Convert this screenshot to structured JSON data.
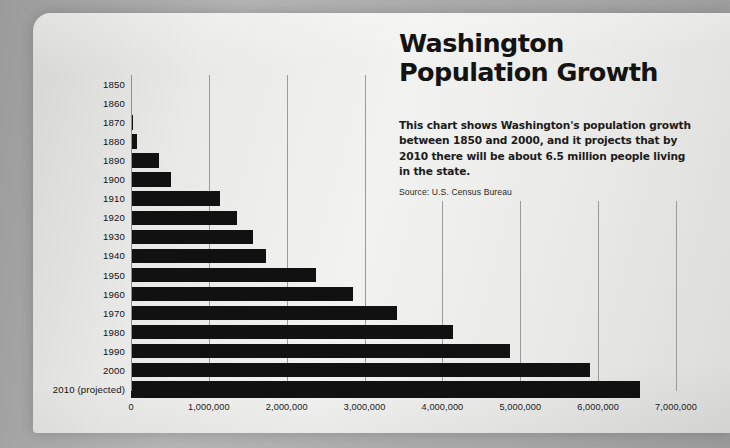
{
  "title": {
    "line1": "Washington",
    "line2": "Population Growth"
  },
  "description": "This chart shows Washington's population growth between 1850 and 2000, and it projects that by 2010 there will be about 6.5 million people living in the state.",
  "source": "Source: U.S. Census Bureau",
  "colors": {
    "bar": "#111111",
    "card": "#eeeeec",
    "background": "#a5a5a5",
    "gridline": "#9a9a9a",
    "text": "#111111"
  },
  "chart_data": {
    "type": "bar",
    "orientation": "horizontal",
    "title": "Washington Population Growth",
    "subtitle": "This chart shows Washington's population growth between 1850 and 2000, and it projects that by 2010 there will be about 6.5 million people living in the state.",
    "source": "Source: U.S. Census Bureau",
    "xlabel": "",
    "ylabel": "",
    "xlim": [
      0,
      7000000
    ],
    "grid": true,
    "legend": null,
    "categories": [
      "1850",
      "1860",
      "1870",
      "1880",
      "1890",
      "1900",
      "1910",
      "1920",
      "1930",
      "1940",
      "1950",
      "1960",
      "1970",
      "1980",
      "1990",
      "2000",
      "2010 (projected)"
    ],
    "values": [
      12000,
      12000,
      24000,
      75000,
      357000,
      518000,
      1142000,
      1357000,
      1563000,
      1736000,
      2379000,
      2853000,
      3413000,
      4132000,
      4867000,
      5894000,
      6540000
    ],
    "xticks": [
      0,
      1000000,
      2000000,
      3000000,
      4000000,
      5000000,
      6000000,
      7000000
    ],
    "xticklabels": [
      "0",
      "1,000,000",
      "2,000,000",
      "3,000,000",
      "4,000,000",
      "5,000,000",
      "6,000,000",
      "7,000,000"
    ]
  }
}
